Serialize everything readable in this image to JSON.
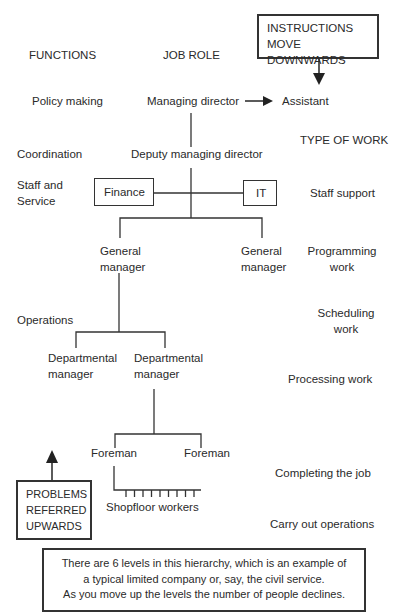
{
  "headers": {
    "functions": "FUNCTIONS",
    "job_role": "JOB ROLE",
    "type_of_work": "TYPE OF WORK"
  },
  "callouts": {
    "instructions": [
      "INSTRUCTIONS",
      "MOVE DOWNWARDS"
    ],
    "problems": [
      "PROBLEMS",
      "REFERRED",
      "UPWARDS"
    ]
  },
  "functions": {
    "policy": "Policy making",
    "coordination": "Coordination",
    "staff_service_1": "Staff and",
    "staff_service_2": "Service",
    "operations": "Operations"
  },
  "roles": {
    "managing_director": "Managing director",
    "assistant": "Assistant",
    "deputy": "Deputy managing director",
    "finance": "Finance",
    "it": "IT",
    "gm_left_1": "General",
    "gm_left_2": "manager",
    "gm_right_1": "General",
    "gm_right_2": "manager",
    "dm_left_1": "Departmental",
    "dm_left_2": "manager",
    "dm_right_1": "Departmental",
    "dm_right_2": "manager",
    "foreman_left": "Foreman",
    "foreman_right": "Foreman",
    "shopfloor": "Shopfloor workers"
  },
  "work": {
    "staff_support": "Staff support",
    "programming_1": "Programming",
    "programming_2": "work",
    "scheduling_1": "Scheduling",
    "scheduling_2": "work",
    "processing": "Processing work",
    "completing": "Completing the job",
    "carry_out": "Carry out operations"
  },
  "note": [
    "There are 6 levels in this hierarchy, which is an example of",
    "a typical limited company or, say, the civil service.",
    "As you move up the levels the number of people declines."
  ]
}
